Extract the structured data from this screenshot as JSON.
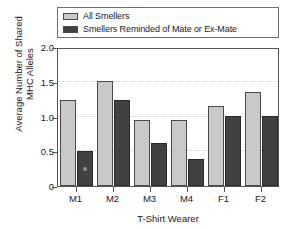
{
  "chart_data": {
    "type": "bar",
    "title": "",
    "xlabel": "T-Shirt Wearer",
    "ylabel": "Average Number of Shared\nMHC Alleles",
    "categories": [
      "M1",
      "M2",
      "M3",
      "M4",
      "F1",
      "F2"
    ],
    "series": [
      {
        "name": "All Smellers",
        "color": "#c9c9c9",
        "values": [
          1.24,
          1.51,
          0.95,
          0.95,
          1.15,
          1.35
        ]
      },
      {
        "name": "Smellers Reminded of Mate or Ex-Mate",
        "color": "#414141",
        "values": [
          0.51,
          1.24,
          0.62,
          0.39,
          1.01,
          1.01
        ]
      }
    ],
    "ylim": [
      0,
      2.0
    ],
    "yticks": [
      0,
      0.5,
      1.0,
      1.5,
      2.0
    ],
    "ytick_labels": [
      "0",
      "0.5",
      "1.0",
      "1.5",
      "2.0"
    ],
    "grid": true,
    "grid_axis": "y",
    "legend_position": "above-plot",
    "annotations": [
      {
        "type": "marker-dot",
        "series": "Smellers Reminded of Mate or Ex-Mate",
        "category": "M1",
        "color": "#8d8d8d"
      }
    ]
  },
  "legend": {
    "entries": [
      {
        "label": "All Smellers",
        "color": "#c9c9c9"
      },
      {
        "label": "Smellers Reminded of Mate or Ex-Mate",
        "color": "#414141"
      }
    ]
  },
  "axes": {
    "y_title": "Average Number of Shared\nMHC Alleles",
    "x_title": "T-Shirt Wearer",
    "y_tick_labels": [
      "2.0",
      "1.5",
      "1.0",
      "0.5",
      "0"
    ],
    "x_tick_labels": [
      "M1",
      "M2",
      "M3",
      "M4",
      "F1",
      "F2"
    ]
  }
}
